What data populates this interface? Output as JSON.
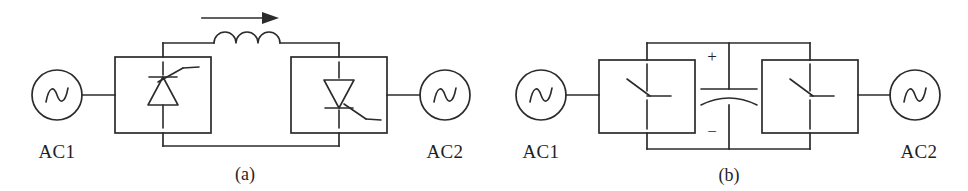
{
  "figure": {
    "background_color": "#ffffff",
    "line_color": "#2b2b2b"
  },
  "panels": [
    {
      "id": "a",
      "caption": "(a)",
      "type": "line-commutated-converter",
      "source_left_label": "AC1",
      "source_right_label": "AC2",
      "dc_link_element": "inductor",
      "dc_link_element_name": "smoothing-reactor",
      "inductor_coils": 3,
      "current_arrow": "right",
      "converter_left_symbol": "thyristor-up",
      "converter_right_symbol": "thyristor-down"
    },
    {
      "id": "b",
      "caption": "(b)",
      "type": "voltage-source-converter",
      "source_left_label": "AC1",
      "source_right_label": "AC2",
      "dc_link_element": "capacitor",
      "dc_link_element_name": "dc-link-capacitor",
      "polarity_top": "+",
      "polarity_bottom": "−",
      "converter_left_symbol": "transistor-switch",
      "converter_right_symbol": "transistor-switch"
    }
  ]
}
